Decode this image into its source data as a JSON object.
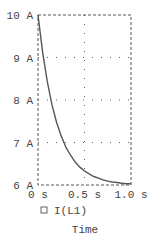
{
  "chart_data": {
    "type": "line",
    "title": "",
    "xlabel": "Time",
    "ylabel": "",
    "xlim": [
      0,
      1.0
    ],
    "ylim": [
      6,
      10
    ],
    "x_ticks": [
      {
        "value": 0,
        "label": "0 s"
      },
      {
        "value": 0.5,
        "label": "0.5 s"
      },
      {
        "value": 1.0,
        "label": "1.0 s"
      }
    ],
    "y_ticks": [
      {
        "value": 10,
        "label": "10 A"
      },
      {
        "value": 9,
        "label": "9 A"
      },
      {
        "value": 8,
        "label": "8 A"
      },
      {
        "value": 7,
        "label": "7 A"
      },
      {
        "value": 6,
        "label": "6 A"
      }
    ],
    "grid": true,
    "legend_position": "bottom-left",
    "series": [
      {
        "name": "I(L1)",
        "color": "#555555",
        "x": [
          0,
          0.05,
          0.1,
          0.15,
          0.2,
          0.25,
          0.3,
          0.35,
          0.4,
          0.45,
          0.5,
          0.55,
          0.6,
          0.65,
          0.7,
          0.75,
          0.8,
          0.85,
          0.9,
          0.95,
          1.0
        ],
        "values": [
          10.0,
          9.12,
          8.43,
          7.89,
          7.47,
          7.15,
          6.89,
          6.7,
          6.54,
          6.42,
          6.33,
          6.26,
          6.2,
          6.16,
          6.12,
          6.09,
          6.07,
          6.06,
          6.04,
          6.03,
          6.03
        ]
      }
    ]
  },
  "legend": {
    "items": [
      {
        "label": "I(L1)",
        "marker": "square-outline"
      }
    ]
  },
  "axis": {
    "x_title": "Time"
  },
  "colors": {
    "frame": "#555555",
    "grid": "#666666",
    "trace": "#555555",
    "text": "#444444"
  }
}
